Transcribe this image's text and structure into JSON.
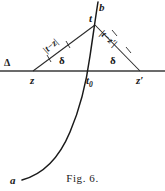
{
  "figure": {
    "caption": "Fig. 6.",
    "axis_label": "Δ",
    "labels": {
      "z": "z",
      "z_prime": "z′",
      "t": "t",
      "t0_base": "t",
      "t0_sub": "0",
      "b": "b",
      "a": "a",
      "angle_left": "δ",
      "angle_right": "δ",
      "dist_left": "|t−z|",
      "dist_right": "|t−z′|"
    },
    "colors": {
      "ink": "#1a1a1a",
      "background": "#ffffff",
      "axis_line": "#3a3a3a",
      "curve": "#1a1a1a"
    },
    "geometry": {
      "axis_y": 71,
      "axis_x_start": 0,
      "axis_x_end": 165,
      "vertex_z_x": 33,
      "vertex_z_prime_x": 140,
      "apex_t_x": 95,
      "apex_t_y": 25,
      "t0_x": 88,
      "t0_y": 71,
      "curve_top_b_x": 98,
      "curve_top_b_y": 2,
      "curve_end_a_x": 22,
      "curve_end_a_y": 180
    }
  }
}
